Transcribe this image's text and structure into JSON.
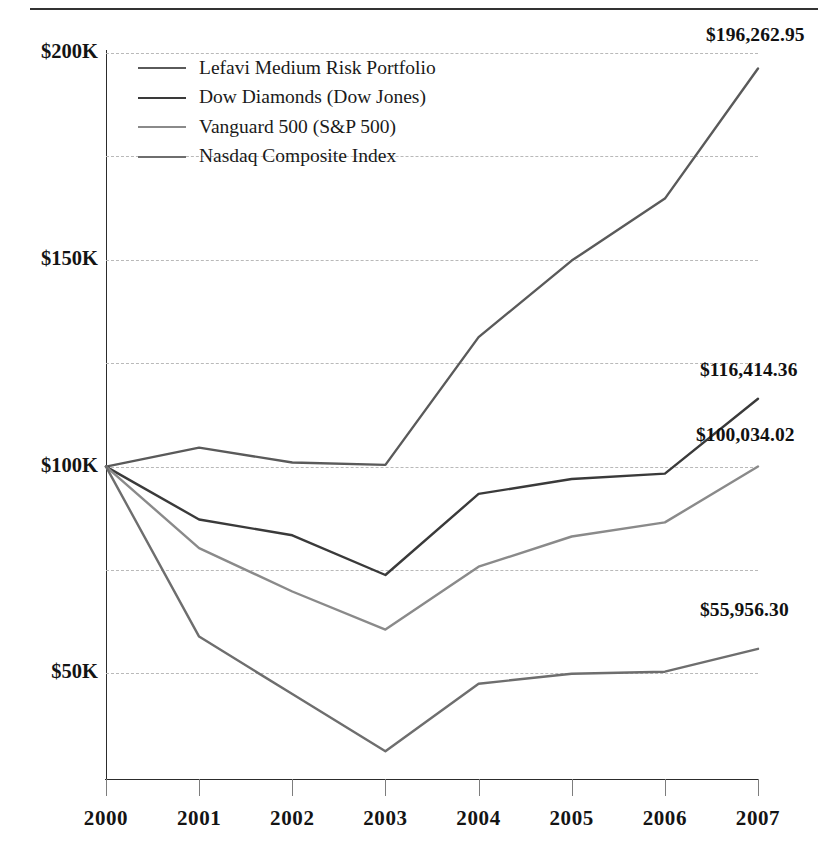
{
  "figure": {
    "background_color": "#ffffff",
    "rule_color": "#333333",
    "axis_color": "#2c2c2c",
    "grid_color": "#b9b9b9"
  },
  "legend": {
    "position": "top-left-inside",
    "items": [
      {
        "label": "Lefavi Medium Risk Portfolio",
        "color": "#5a5a5a",
        "width": 2.6
      },
      {
        "label": "Dow Diamonds (Dow Jones)",
        "color": "#3a3a3a",
        "width": 2.6
      },
      {
        "label": "Vanguard 500 (S&P 500)",
        "color": "#8a8a8a",
        "width": 2.2
      },
      {
        "label": "Nasdaq Composite Index",
        "color": "#6e6e6e",
        "width": 2.2
      }
    ]
  },
  "y_axis": {
    "tick_labels": [
      "$200K",
      "$150K",
      "$100K",
      "$50K"
    ],
    "tick_values": [
      200000,
      150000,
      100000,
      50000
    ],
    "gridline_values": [
      200000,
      175000,
      150000,
      125000,
      100000,
      75000,
      50000
    ],
    "range": [
      25000,
      200000
    ]
  },
  "x_axis": {
    "tick_labels": [
      "2000",
      "2001",
      "2002",
      "2003",
      "2004",
      "2005",
      "2006",
      "2007"
    ]
  },
  "endpoint_labels": [
    {
      "text": "$196,262.95",
      "series": "Lefavi Medium Risk Portfolio"
    },
    {
      "text": "$116,414.36",
      "series": "Dow Diamonds (Dow Jones)"
    },
    {
      "text": "$100,034.02",
      "series": "Vanguard 500 (S&P 500)"
    },
    {
      "text": "$55,956.30",
      "series": "Nasdaq Composite Index"
    }
  ],
  "chart_data": {
    "type": "line",
    "title": "",
    "subtitle": "",
    "xlabel": "",
    "ylabel": "",
    "x": [
      2000,
      2001,
      2002,
      2003,
      2004,
      2005,
      2006,
      2007
    ],
    "categories": [
      "2000",
      "2001",
      "2002",
      "2003",
      "2004",
      "2005",
      "2006",
      "2007"
    ],
    "xlim": [
      2000,
      2007
    ],
    "ylim": [
      25000,
      200000
    ],
    "grid": true,
    "legend_position": "upper left",
    "value_format": "$#,###.##",
    "series": [
      {
        "name": "Lefavi Medium Risk Portfolio",
        "color": "#5a5a5a",
        "values": [
          100000,
          104600,
          101000,
          100400,
          131300,
          149800,
          164800,
          196262.95
        ],
        "end_label": "$196,262.95"
      },
      {
        "name": "Dow Diamonds (Dow Jones)",
        "color": "#3a3a3a",
        "values": [
          100000,
          87200,
          83400,
          73800,
          93400,
          97000,
          98300,
          116414.36
        ],
        "end_label": "$116,414.36"
      },
      {
        "name": "Vanguard 500 (S&P 500)",
        "color": "#8a8a8a",
        "values": [
          100000,
          80300,
          69800,
          60600,
          75800,
          83100,
          86500,
          100034.02
        ],
        "end_label": "$100,034.02"
      },
      {
        "name": "Nasdaq Composite Index",
        "color": "#6e6e6e",
        "values": [
          100000,
          58900,
          45000,
          31200,
          47500,
          49900,
          50400,
          55956.3
        ],
        "end_label": "$55,956.30"
      }
    ]
  }
}
